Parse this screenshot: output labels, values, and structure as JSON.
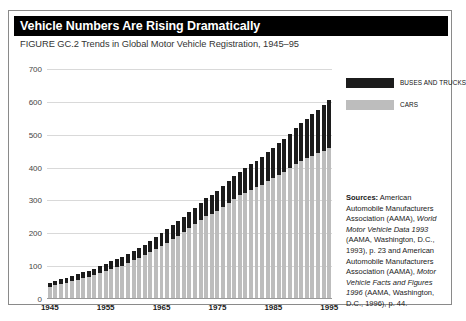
{
  "header": {
    "title": "Vehicle Numbers Are Rising Dramatically",
    "subtitle": "FIGURE GC.2 Trends in Global Motor Vehicle Registration, 1945–95"
  },
  "legend": {
    "items": [
      {
        "label": "BUSES AND TRUCKS",
        "color": "#1c1c1c",
        "name": "legend-buses-and-trucks"
      },
      {
        "label": "CARS",
        "color": "#bdbdbd",
        "name": "legend-cars"
      }
    ]
  },
  "sources": {
    "label": "Sources:",
    "text_1": " American Automobile Manufacturers Association (AAMA), ",
    "italic_1": "World Motor Vehicle Data 1993",
    "text_2": " (AAMA, Washington, D.C., 1993), p. 23 and American Automobile Manufacturers Association (AAMA), ",
    "italic_2": "Motor Vehicle Facts and Figures 1996",
    "text_3": " (AAMA, Washington, D.C., 1996), p. 44."
  },
  "chart_data": {
    "type": "bar",
    "subtype": "stacked-bar",
    "title": "Vehicle Numbers Are Rising Dramatically",
    "subtitle": "FIGURE GC.2 Trends in Global Motor Vehicle Registration, 1945–95",
    "xlabel": "",
    "ylabel": "",
    "ylim": [
      0,
      700
    ],
    "yticks": [
      0,
      100,
      200,
      300,
      400,
      500,
      600,
      700
    ],
    "xticks": [
      1945,
      1955,
      1965,
      1975,
      1985,
      1995
    ],
    "grid": true,
    "legend_position": "top-right",
    "units": "millions of vehicles",
    "categories": [
      1945,
      1946,
      1947,
      1948,
      1949,
      1950,
      1951,
      1952,
      1953,
      1954,
      1955,
      1956,
      1957,
      1958,
      1959,
      1960,
      1961,
      1962,
      1963,
      1964,
      1965,
      1966,
      1967,
      1968,
      1969,
      1970,
      1971,
      1972,
      1973,
      1974,
      1975,
      1976,
      1977,
      1978,
      1979,
      1980,
      1981,
      1982,
      1983,
      1984,
      1985,
      1986,
      1987,
      1988,
      1989,
      1990,
      1991,
      1992,
      1993,
      1994,
      1995
    ],
    "series": [
      {
        "name": "CARS",
        "color": "#bdbdbd",
        "values": [
          38,
          42,
          46,
          50,
          54,
          58,
          63,
          67,
          72,
          78,
          85,
          91,
          97,
          102,
          110,
          118,
          125,
          133,
          142,
          152,
          162,
          172,
          182,
          193,
          205,
          216,
          228,
          240,
          252,
          260,
          268,
          280,
          292,
          304,
          316,
          324,
          332,
          340,
          348,
          358,
          368,
          378,
          388,
          398,
          410,
          420,
          428,
          436,
          444,
          452,
          460
        ]
      },
      {
        "name": "BUSES AND TRUCKS",
        "color": "#1c1c1c",
        "values": [
          12,
          13,
          14,
          15,
          16,
          17,
          18,
          19,
          20,
          21,
          23,
          24,
          25,
          26,
          28,
          29,
          31,
          32,
          34,
          36,
          38,
          40,
          42,
          44,
          46,
          48,
          50,
          53,
          56,
          58,
          60,
          63,
          66,
          69,
          72,
          75,
          78,
          81,
          84,
          88,
          92,
          96,
          100,
          105,
          110,
          115,
          120,
          126,
          132,
          138,
          145
        ]
      }
    ],
    "totals": [
      50,
      55,
      60,
      65,
      70,
      75,
      81,
      86,
      92,
      99,
      108,
      115,
      122,
      128,
      138,
      147,
      156,
      165,
      176,
      188,
      200,
      212,
      224,
      237,
      251,
      264,
      278,
      293,
      308,
      318,
      328,
      343,
      358,
      373,
      388,
      399,
      410,
      421,
      432,
      446,
      460,
      474,
      488,
      503,
      520,
      535,
      548,
      562,
      576,
      590,
      605
    ]
  }
}
